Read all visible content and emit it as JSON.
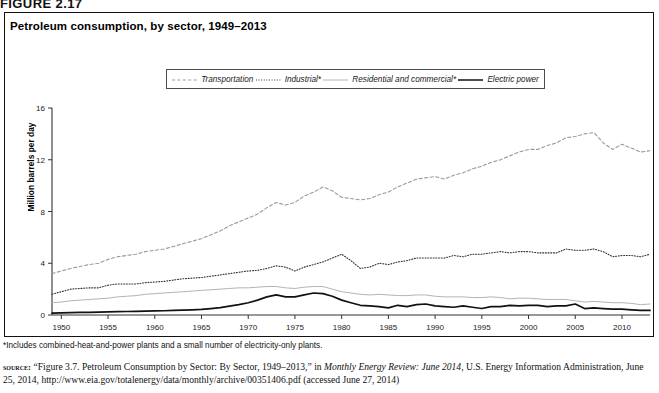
{
  "figure_label": "FIGURE 2.17",
  "chart_title": "Petroleum consumption, by sector, 1949–2013",
  "y_axis_title": "Million barrels per day",
  "footnote": "*Includes combined-heat-and-power plants and a small number of electricity-only plants.",
  "source": {
    "kicker": "source:",
    "part1": " “Figure 3.7. Petroleum Consumption by Sector: By Sector, 1949–2013,” in ",
    "italic1": "Monthly Energy Review: June 2014",
    "part2": ", U.S. Energy Information Administration, June 25, 2014, http://www.eia.gov/totalenergy/data/monthly/archive/00351406.pdf (accessed June 27, 2014)"
  },
  "colors": {
    "transportation": "#9a9a9a",
    "industrial": "#333333",
    "residential": "#b4b4b4",
    "electric": "#111111",
    "axis": "#333333",
    "frame": "#111111"
  },
  "chart_data": {
    "type": "line",
    "title": "Petroleum consumption, by sector, 1949–2013",
    "xlabel": "",
    "ylabel": "Million barrels per day",
    "xlim": [
      1949,
      2013
    ],
    "ylim": [
      0,
      16
    ],
    "yticks": [
      0,
      4,
      8,
      12,
      16
    ],
    "xticks": [
      1950,
      1955,
      1960,
      1965,
      1970,
      1975,
      1980,
      1985,
      1990,
      1995,
      2000,
      2005,
      2010
    ],
    "grid": false,
    "legend_position": "top-center",
    "x": [
      1949,
      1950,
      1951,
      1952,
      1953,
      1954,
      1955,
      1956,
      1957,
      1958,
      1959,
      1960,
      1961,
      1962,
      1963,
      1964,
      1965,
      1966,
      1967,
      1968,
      1969,
      1970,
      1971,
      1972,
      1973,
      1974,
      1975,
      1976,
      1977,
      1978,
      1979,
      1980,
      1981,
      1982,
      1983,
      1984,
      1985,
      1986,
      1987,
      1988,
      1989,
      1990,
      1991,
      1992,
      1993,
      1994,
      1995,
      1996,
      1997,
      1998,
      1999,
      2000,
      2001,
      2002,
      2003,
      2004,
      2005,
      2006,
      2007,
      2008,
      2009,
      2010,
      2011,
      2012,
      2013
    ],
    "series": [
      {
        "name": "Transportation",
        "style": "dashed",
        "color": "#9a9a9a",
        "values": [
          3.2,
          3.4,
          3.6,
          3.75,
          3.9,
          4.0,
          4.3,
          4.5,
          4.6,
          4.7,
          4.9,
          5.0,
          5.1,
          5.3,
          5.5,
          5.7,
          5.9,
          6.2,
          6.5,
          6.9,
          7.2,
          7.5,
          7.8,
          8.3,
          8.7,
          8.5,
          8.7,
          9.2,
          9.5,
          9.9,
          9.6,
          9.1,
          9.0,
          8.9,
          9.0,
          9.3,
          9.5,
          9.9,
          10.2,
          10.5,
          10.6,
          10.7,
          10.5,
          10.8,
          11.0,
          11.3,
          11.5,
          11.8,
          12.0,
          12.3,
          12.6,
          12.8,
          12.8,
          13.1,
          13.3,
          13.7,
          13.8,
          14.0,
          14.1,
          13.3,
          12.8,
          13.2,
          12.9,
          12.6,
          12.7
        ]
      },
      {
        "name": "Industrial*",
        "style": "dotted",
        "color": "#333333",
        "values": [
          1.6,
          1.8,
          2.0,
          2.05,
          2.1,
          2.1,
          2.3,
          2.4,
          2.4,
          2.4,
          2.5,
          2.55,
          2.6,
          2.7,
          2.8,
          2.85,
          2.9,
          3.0,
          3.1,
          3.2,
          3.3,
          3.4,
          3.45,
          3.6,
          3.8,
          3.7,
          3.4,
          3.7,
          3.9,
          4.1,
          4.4,
          4.7,
          4.2,
          3.6,
          3.7,
          4.0,
          3.9,
          4.1,
          4.2,
          4.4,
          4.4,
          4.4,
          4.4,
          4.6,
          4.5,
          4.7,
          4.7,
          4.8,
          4.9,
          4.8,
          4.9,
          4.9,
          4.8,
          4.8,
          4.8,
          5.1,
          5.0,
          5.0,
          5.1,
          4.9,
          4.5,
          4.6,
          4.6,
          4.5,
          4.7
        ]
      },
      {
        "name": "Residential and commercial*",
        "style": "solid-light",
        "color": "#b4b4b4",
        "values": [
          0.95,
          1.0,
          1.1,
          1.15,
          1.2,
          1.25,
          1.3,
          1.4,
          1.45,
          1.5,
          1.6,
          1.65,
          1.7,
          1.75,
          1.8,
          1.85,
          1.9,
          1.95,
          2.0,
          2.05,
          2.1,
          2.1,
          2.15,
          2.2,
          2.2,
          2.1,
          2.05,
          2.15,
          2.2,
          2.2,
          2.0,
          1.8,
          1.7,
          1.6,
          1.55,
          1.6,
          1.55,
          1.5,
          1.5,
          1.55,
          1.55,
          1.45,
          1.4,
          1.4,
          1.4,
          1.35,
          1.35,
          1.4,
          1.35,
          1.25,
          1.3,
          1.3,
          1.25,
          1.2,
          1.2,
          1.2,
          1.1,
          1.0,
          1.05,
          1.0,
          0.95,
          0.95,
          0.9,
          0.8,
          0.85
        ]
      },
      {
        "name": "Electric power",
        "style": "solid-dark",
        "color": "#111111",
        "values": [
          0.15,
          0.17,
          0.18,
          0.2,
          0.2,
          0.22,
          0.24,
          0.26,
          0.27,
          0.28,
          0.3,
          0.32,
          0.33,
          0.35,
          0.37,
          0.4,
          0.43,
          0.5,
          0.57,
          0.68,
          0.8,
          0.95,
          1.15,
          1.4,
          1.55,
          1.4,
          1.4,
          1.55,
          1.7,
          1.65,
          1.45,
          1.15,
          0.95,
          0.75,
          0.7,
          0.65,
          0.55,
          0.75,
          0.65,
          0.8,
          0.85,
          0.7,
          0.65,
          0.6,
          0.7,
          0.6,
          0.5,
          0.65,
          0.65,
          0.75,
          0.7,
          0.75,
          0.75,
          0.65,
          0.7,
          0.7,
          0.85,
          0.5,
          0.55,
          0.5,
          0.45,
          0.45,
          0.4,
          0.35,
          0.35
        ]
      }
    ]
  }
}
